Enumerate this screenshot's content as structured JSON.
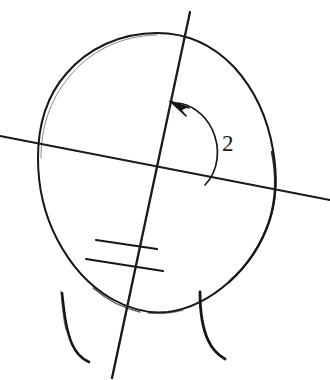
{
  "figure": {
    "background_color": "#ffffff",
    "ink_color": "#161616",
    "width": 330,
    "height": 380
  },
  "labels": {
    "angle_2": "2"
  },
  "elements": {
    "head_outline_name": "head-ellipse-outline",
    "vertical_axis_name": "oblique-vertical-axis-line",
    "horizontal_axis_name": "oblique-horizontal-axis-line",
    "angle_arc_name": "angle-arc-with-arrow",
    "arrow_head_name": "arrow-head-icon",
    "tick_upper_name": "upper-tick-mark",
    "tick_lower_name": "lower-tick-mark",
    "neck_left_name": "left-neck-line",
    "neck_right_name": "right-neck-line"
  },
  "geometry": {
    "head_center": [
      157,
      172
    ],
    "head_radius_x": 118,
    "head_radius_y": 140,
    "axis_crossing_point": [
      157,
      172
    ],
    "vertical_axis_top": [
      190,
      12
    ],
    "vertical_axis_bottom": [
      112,
      378
    ],
    "horizontal_axis_left": [
      0,
      136
    ],
    "horizontal_axis_right": [
      330,
      200
    ],
    "angle_label_position": [
      222,
      132
    ]
  }
}
